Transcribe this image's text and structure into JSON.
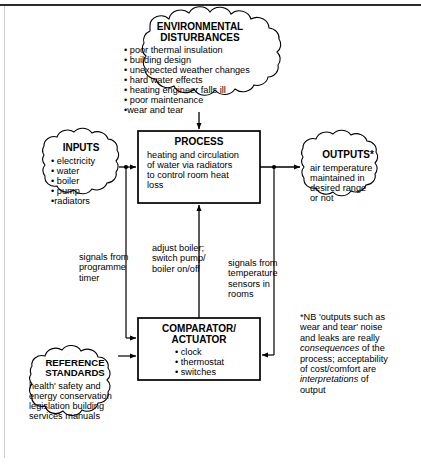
{
  "diagram": {
    "frame": {
      "top_rule": true,
      "left_rule": true
    }
  },
  "nodes": {
    "environmental": {
      "shape": "cloud",
      "title": "ENVIRONMENTAL\nDISTURBANCES",
      "items": [
        "• poor thermal insulation",
        "• building design",
        "• unexpected weather changes",
        "• hard water effects",
        "• heating engineer falls ill",
        "• poor maintenance",
        "•wear and tear"
      ]
    },
    "inputs": {
      "shape": "cloud",
      "title": "INPUTS",
      "items": [
        "• electricity",
        "• water",
        "• boiler",
        "• pump",
        "•radiators"
      ]
    },
    "process": {
      "shape": "box",
      "title": "PROCESS",
      "body": "heating and circulation\nof water via radiators\nto control room heat\nloss"
    },
    "outputs": {
      "shape": "cloud",
      "title": "OUTPUTS*",
      "body": "air temperature\nmaintained in\ndesired range\nor not"
    },
    "comparator": {
      "shape": "box",
      "title": "COMPARATOR/\nACTUATOR",
      "items": [
        "• clock",
        "• thermostat",
        "• switches"
      ]
    },
    "reference": {
      "shape": "cloud",
      "title": "REFERENCE\nSTANDARDS",
      "body": "health' safety and\nenergy conservation\nlegislation building\nservices manuals"
    }
  },
  "connector_labels": {
    "programme_timer": "signals from\nprogramme\ntimer",
    "adjust_boiler": "adjust boiler;\nswitch pump/\nboiler on/off",
    "temperature_sensors": "signals from\ntemperature\nsensors in\nrooms"
  },
  "footnote": {
    "line1": "*NB 'outputs such as",
    "line2": "wear and tear' noise",
    "line3": "and leaks are really",
    "italic1": "consequences",
    "line4": " of the",
    "line5": "process; acceptability",
    "line6": "of cost/comfort are",
    "italic2": "interpretations",
    "line7": " of",
    "line8": "output"
  },
  "colors": {
    "stroke": "#000000",
    "background": "#ffffff",
    "rule": "#2b2b2b"
  }
}
